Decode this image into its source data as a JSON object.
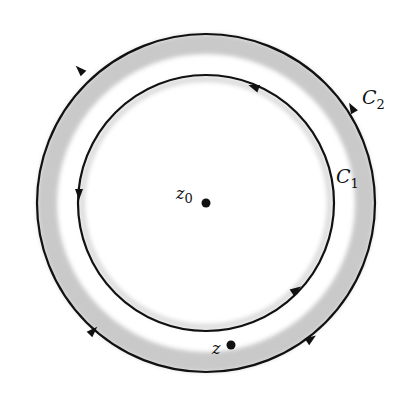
{
  "diagram": {
    "center": {
      "x": 206,
      "y": 203
    },
    "colors": {
      "stroke": "#111111",
      "band": "#c9c9c9",
      "background": "#ffffff"
    },
    "contours": [
      {
        "name": "C2",
        "label": "C",
        "subscript": "2",
        "radius": 170,
        "orientation": "counterclockwise",
        "label_pos": {
          "x": 362,
          "y": 104
        }
      },
      {
        "name": "C1",
        "label": "C",
        "subscript": "1",
        "radius": 128,
        "orientation": "counterclockwise",
        "label_pos": {
          "x": 336,
          "y": 183
        }
      }
    ],
    "annulus_band": {
      "outer_radius": 168,
      "inner_radius": 148
    },
    "points": [
      {
        "name": "z0",
        "label": "z",
        "subscript": "0",
        "x": 206,
        "y": 203,
        "label_pos": {
          "x": 176,
          "y": 199
        }
      },
      {
        "name": "z",
        "label": "z",
        "subscript": "",
        "x": 231,
        "y": 345,
        "label_pos": {
          "x": 212,
          "y": 354
        }
      }
    ]
  }
}
